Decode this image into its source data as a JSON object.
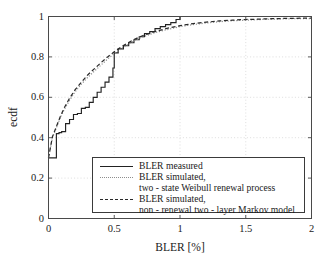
{
  "chart_data": {
    "type": "line",
    "title": "",
    "xlabel": "BLER [%]",
    "ylabel": "ecdf",
    "xlim": [
      0,
      2
    ],
    "ylim": [
      0,
      1
    ],
    "xticks": [
      "0",
      "0.5",
      "1",
      "1.5",
      "2"
    ],
    "xtick_values": [
      0,
      0.5,
      1,
      1.5,
      2
    ],
    "yticks": [
      "0",
      "0.2",
      "0.4",
      "0.6",
      "0.8",
      "1"
    ],
    "ytick_values": [
      0,
      0.2,
      0.4,
      0.6,
      0.8,
      1
    ],
    "grid": true,
    "legend_position": "lower center",
    "series": [
      {
        "name": "BLER measured",
        "style": "solid",
        "color": "#222222",
        "step": true,
        "x": [
          0,
          0.02,
          0.06,
          0.08,
          0.1,
          0.13,
          0.16,
          0.19,
          0.22,
          0.25,
          0.28,
          0.31,
          0.34,
          0.37,
          0.4,
          0.43,
          0.46,
          0.49,
          0.5,
          0.53,
          0.57,
          0.61,
          0.65,
          0.69,
          0.73,
          0.77,
          0.81,
          0.85,
          0.89,
          0.93,
          0.97,
          1.0,
          1.3,
          1.6,
          2.0
        ],
        "y": [
          0.3,
          0.3,
          0.42,
          0.425,
          0.43,
          0.47,
          0.49,
          0.515,
          0.52,
          0.545,
          0.55,
          0.575,
          0.6,
          0.625,
          0.65,
          0.675,
          0.7,
          0.745,
          0.82,
          0.84,
          0.855,
          0.87,
          0.885,
          0.9,
          0.915,
          0.925,
          0.94,
          0.95,
          0.96,
          0.97,
          0.985,
          1.0,
          1.0,
          1.0,
          1.0
        ]
      },
      {
        "name": "BLER simulated, two-state Weibull renewal process",
        "style": "dotted",
        "color": "#8d8d8d",
        "step": false,
        "x": [
          0,
          0.03,
          0.06,
          0.09,
          0.12,
          0.16,
          0.2,
          0.25,
          0.3,
          0.35,
          0.4,
          0.45,
          0.5,
          0.55,
          0.6,
          0.65,
          0.7,
          0.8,
          0.9,
          1.0,
          1.1,
          1.2,
          1.3,
          1.4,
          1.5,
          1.7,
          1.85,
          2.0
        ],
        "y": [
          0.3,
          0.4,
          0.45,
          0.5,
          0.54,
          0.585,
          0.625,
          0.665,
          0.7,
          0.73,
          0.76,
          0.79,
          0.815,
          0.84,
          0.86,
          0.88,
          0.895,
          0.918,
          0.935,
          0.95,
          0.96,
          0.968,
          0.974,
          0.979,
          0.982,
          0.987,
          0.989,
          0.99
        ]
      },
      {
        "name": "BLER simulated, non-renewal two-layer Markov model",
        "style": "dashed",
        "color": "#2a2a2a",
        "step": false,
        "x": [
          0,
          0.03,
          0.06,
          0.09,
          0.12,
          0.16,
          0.2,
          0.25,
          0.3,
          0.35,
          0.4,
          0.45,
          0.5,
          0.55,
          0.6,
          0.65,
          0.7,
          0.8,
          0.9,
          1.0,
          1.1,
          1.2,
          1.3,
          1.4,
          1.5,
          1.7,
          1.85,
          2.0
        ],
        "y": [
          0.3,
          0.405,
          0.455,
          0.505,
          0.548,
          0.595,
          0.635,
          0.675,
          0.712,
          0.742,
          0.772,
          0.8,
          0.825,
          0.848,
          0.868,
          0.886,
          0.901,
          0.924,
          0.941,
          0.955,
          0.965,
          0.972,
          0.978,
          0.982,
          0.985,
          0.989,
          0.991,
          0.992
        ]
      }
    ]
  },
  "legend": {
    "entries": [
      {
        "sample": "solid",
        "lines": [
          "BLER measured"
        ]
      },
      {
        "sample": "dotted",
        "lines": [
          "BLER simulated,",
          "two - state Weibull renewal process"
        ]
      },
      {
        "sample": "dashed",
        "lines": [
          "BLER simulated,",
          "non - renewal two - layer Markov model"
        ]
      }
    ]
  }
}
